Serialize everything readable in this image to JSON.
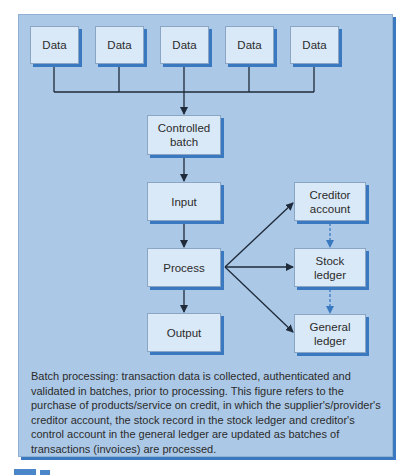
{
  "diagram": {
    "data_boxes": [
      {
        "label": "Data"
      },
      {
        "label": "Data"
      },
      {
        "label": "Data"
      },
      {
        "label": "Data"
      },
      {
        "label": "Data"
      }
    ],
    "flow": {
      "controlled_batch": {
        "line1": "Controlled",
        "line2": "batch"
      },
      "input": {
        "label": "Input"
      },
      "process": {
        "label": "Process"
      },
      "output": {
        "label": "Output"
      }
    },
    "ledgers": {
      "creditor_account": {
        "line1": "Creditor",
        "line2": "account"
      },
      "stock_ledger": {
        "line1": "Stock",
        "line2": "ledger"
      },
      "general_ledger": {
        "line1": "General",
        "line2": "ledger"
      }
    },
    "caption": "Batch processing: transaction data is collected, authenticated and validated in batches, prior to processing. This figure refers to the purchase of products/service on credit, in which the supplier's/provider's creditor account, the stock record in the stock ledger and creditor's control account in the general ledger are updated as batches of transactions (invoices) are processed.",
    "colors": {
      "panel_bg": "#abc9e7",
      "box_bg": "#dae9f7",
      "shadow": "#3a78c0",
      "arrow": "#1f2a3a",
      "dashed_arrow": "#3a78c0"
    }
  }
}
